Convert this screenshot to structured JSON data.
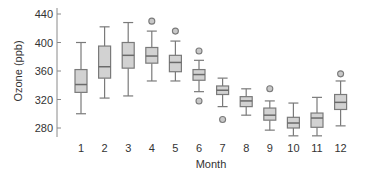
{
  "chart_data": {
    "type": "box",
    "title": "",
    "xlabel": "Month",
    "ylabel": "Ozone (ppb)",
    "ylim": [
      270,
      445
    ],
    "yticks": [
      280,
      320,
      360,
      400,
      440
    ],
    "categories": [
      "1",
      "2",
      "3",
      "4",
      "5",
      "6",
      "7",
      "8",
      "9",
      "10",
      "11",
      "12"
    ],
    "grid": false,
    "legend": null,
    "boxes": [
      {
        "month": "1",
        "whisker_low": 300,
        "q1": 330,
        "median": 341,
        "q3": 362,
        "whisker_high": 400,
        "outliers": []
      },
      {
        "month": "2",
        "whisker_low": 322,
        "q1": 350,
        "median": 366,
        "q3": 395,
        "whisker_high": 422,
        "outliers": []
      },
      {
        "month": "3",
        "whisker_low": 325,
        "q1": 364,
        "median": 382,
        "q3": 400,
        "whisker_high": 428,
        "outliers": []
      },
      {
        "month": "4",
        "whisker_low": 346,
        "q1": 371,
        "median": 381,
        "q3": 393,
        "whisker_high": 416,
        "outliers": [
          430
        ]
      },
      {
        "month": "5",
        "whisker_low": 346,
        "q1": 359,
        "median": 372,
        "q3": 382,
        "whisker_high": 402,
        "outliers": [
          416
        ]
      },
      {
        "month": "6",
        "whisker_low": 331,
        "q1": 347,
        "median": 355,
        "q3": 362,
        "whisker_high": 375,
        "outliers": [
          388,
          318
        ]
      },
      {
        "month": "7",
        "whisker_low": 310,
        "q1": 327,
        "median": 333,
        "q3": 339,
        "whisker_high": 350,
        "outliers": [
          292
        ]
      },
      {
        "month": "8",
        "whisker_low": 298,
        "q1": 310,
        "median": 318,
        "q3": 324,
        "whisker_high": 335,
        "outliers": []
      },
      {
        "month": "9",
        "whisker_low": 277,
        "q1": 291,
        "median": 298,
        "q3": 308,
        "whisker_high": 318,
        "outliers": [
          335
        ]
      },
      {
        "month": "10",
        "whisker_low": 269,
        "q1": 280,
        "median": 287,
        "q3": 295,
        "whisker_high": 315,
        "outliers": []
      },
      {
        "month": "11",
        "whisker_low": 269,
        "q1": 281,
        "median": 294,
        "q3": 301,
        "whisker_high": 323,
        "outliers": []
      },
      {
        "month": "12",
        "whisker_low": 283,
        "q1": 306,
        "median": 316,
        "q3": 327,
        "whisker_high": 346,
        "outliers": [
          356
        ]
      }
    ],
    "colors": {
      "box_fill": "#d2d2d2",
      "box_stroke": "#7a7a7a",
      "axis": "#8a8a8a",
      "text": "#333333"
    }
  }
}
